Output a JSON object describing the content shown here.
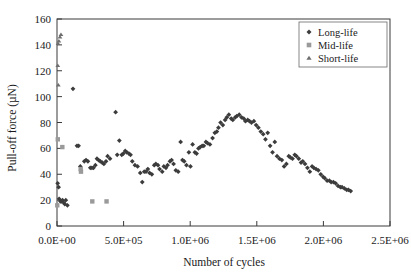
{
  "chart_data": {
    "type": "scatter",
    "title": "",
    "xlabel": "Number of cycles",
    "ylabel": "Pull-off force (µN)",
    "xlim": [
      0,
      2500000
    ],
    "ylim": [
      0,
      160
    ],
    "xticks": [
      0,
      500000,
      1000000,
      1500000,
      2000000,
      2500000
    ],
    "xtick_labels": [
      "0.0E+00",
      "5.0E+05",
      "1.0E+06",
      "1.5E+06",
      "2.0E+06",
      "2.5E+06"
    ],
    "yticks": [
      0,
      20,
      40,
      60,
      80,
      100,
      120,
      140,
      160
    ],
    "ytick_labels": [
      "0",
      "20",
      "40",
      "60",
      "80",
      "100",
      "120",
      "140",
      "160"
    ],
    "grid": false,
    "legend_position": "top-right",
    "series": [
      {
        "name": "Long-life",
        "marker": "diamond",
        "color": "#3c3c3c",
        "points": [
          [
            5000,
            33
          ],
          [
            12000,
            30
          ],
          [
            16000,
            21
          ],
          [
            26000,
            19
          ],
          [
            34000,
            19
          ],
          [
            42000,
            20
          ],
          [
            50000,
            18
          ],
          [
            58000,
            17
          ],
          [
            66000,
            20
          ],
          [
            78000,
            16
          ],
          [
            120000,
            106
          ],
          [
            150000,
            62
          ],
          [
            162000,
            62
          ],
          [
            175000,
            46
          ],
          [
            205000,
            50
          ],
          [
            218000,
            51
          ],
          [
            232000,
            50
          ],
          [
            250000,
            45
          ],
          [
            262000,
            45
          ],
          [
            274000,
            45
          ],
          [
            288000,
            47
          ],
          [
            300000,
            52
          ],
          [
            312000,
            51
          ],
          [
            325000,
            50
          ],
          [
            340000,
            49
          ],
          [
            352000,
            48
          ],
          [
            368000,
            50
          ],
          [
            380000,
            54
          ],
          [
            398000,
            52
          ],
          [
            440000,
            88
          ],
          [
            452000,
            55
          ],
          [
            468000,
            66
          ],
          [
            486000,
            55
          ],
          [
            498000,
            56
          ],
          [
            512000,
            58
          ],
          [
            524000,
            57
          ],
          [
            540000,
            56
          ],
          [
            552000,
            55
          ],
          [
            565000,
            50
          ],
          [
            585000,
            47
          ],
          [
            605000,
            46
          ],
          [
            625000,
            41
          ],
          [
            640000,
            34
          ],
          [
            655000,
            42
          ],
          [
            668000,
            42
          ],
          [
            682000,
            44
          ],
          [
            695000,
            41
          ],
          [
            712000,
            40
          ],
          [
            730000,
            47
          ],
          [
            742000,
            48
          ],
          [
            758000,
            47
          ],
          [
            770000,
            44
          ],
          [
            790000,
            42
          ],
          [
            802000,
            46
          ],
          [
            818000,
            45
          ],
          [
            830000,
            47
          ],
          [
            848000,
            50
          ],
          [
            860000,
            51
          ],
          [
            875000,
            48
          ],
          [
            892000,
            43
          ],
          [
            910000,
            42
          ],
          [
            928000,
            65
          ],
          [
            942000,
            51
          ],
          [
            955000,
            50
          ],
          [
            972000,
            47
          ],
          [
            990000,
            57
          ],
          [
            1002000,
            46
          ],
          [
            1018000,
            63
          ],
          [
            1035000,
            57
          ],
          [
            1048000,
            56
          ],
          [
            1062000,
            60
          ],
          [
            1075000,
            61
          ],
          [
            1090000,
            62
          ],
          [
            1102000,
            62
          ],
          [
            1118000,
            65
          ],
          [
            1130000,
            64
          ],
          [
            1148000,
            63
          ],
          [
            1168000,
            68
          ],
          [
            1185000,
            72
          ],
          [
            1200000,
            73
          ],
          [
            1212000,
            76
          ],
          [
            1228000,
            80
          ],
          [
            1245000,
            78
          ],
          [
            1262000,
            82
          ],
          [
            1275000,
            84
          ],
          [
            1290000,
            86
          ],
          [
            1308000,
            83
          ],
          [
            1320000,
            82
          ],
          [
            1338000,
            84
          ],
          [
            1350000,
            85
          ],
          [
            1368000,
            86
          ],
          [
            1385000,
            84
          ],
          [
            1402000,
            83
          ],
          [
            1415000,
            81
          ],
          [
            1432000,
            82
          ],
          [
            1445000,
            81
          ],
          [
            1460000,
            80
          ],
          [
            1478000,
            81
          ],
          [
            1495000,
            78
          ],
          [
            1512000,
            76
          ],
          [
            1530000,
            73
          ],
          [
            1548000,
            71
          ],
          [
            1565000,
            67
          ],
          [
            1582000,
            72
          ],
          [
            1600000,
            62
          ],
          [
            1618000,
            57
          ],
          [
            1635000,
            65
          ],
          [
            1652000,
            54
          ],
          [
            1670000,
            52
          ],
          [
            1688000,
            51
          ],
          [
            1705000,
            46
          ],
          [
            1722000,
            48
          ],
          [
            1740000,
            54
          ],
          [
            1752000,
            53
          ],
          [
            1768000,
            52
          ],
          [
            1785000,
            55
          ],
          [
            1798000,
            54
          ],
          [
            1815000,
            52
          ],
          [
            1832000,
            49
          ],
          [
            1845000,
            50
          ],
          [
            1862000,
            48
          ],
          [
            1880000,
            45
          ],
          [
            1898000,
            42
          ],
          [
            1915000,
            46
          ],
          [
            1928000,
            45
          ],
          [
            1945000,
            44
          ],
          [
            1962000,
            43
          ],
          [
            1980000,
            40
          ],
          [
            1998000,
            38
          ],
          [
            2010000,
            37
          ],
          [
            2028000,
            35
          ],
          [
            2045000,
            35
          ],
          [
            2058000,
            34
          ],
          [
            2075000,
            34
          ],
          [
            2092000,
            33
          ],
          [
            2110000,
            31
          ],
          [
            2128000,
            30
          ],
          [
            2140000,
            30
          ],
          [
            2158000,
            29
          ],
          [
            2175000,
            28
          ],
          [
            2188000,
            28
          ],
          [
            2205000,
            27
          ]
        ]
      },
      {
        "name": "Mid-life",
        "marker": "square",
        "color": "#9a9a9a",
        "points": [
          [
            2000,
            16
          ],
          [
            6000,
            67
          ],
          [
            40000,
            61
          ],
          [
            178000,
            44
          ],
          [
            180000,
            42
          ],
          [
            265000,
            19
          ],
          [
            372000,
            19
          ]
        ]
      },
      {
        "name": "Short-life",
        "marker": "triangle",
        "color": "#6e6e6e",
        "points": [
          [
            8000,
            141
          ],
          [
            14000,
            143
          ],
          [
            22000,
            146
          ],
          [
            30000,
            148
          ],
          [
            6000,
            124
          ],
          [
            10000,
            109
          ]
        ]
      }
    ]
  },
  "legend": {
    "entries": [
      {
        "label": "Long-life",
        "marker": "diamond",
        "color": "#3c3c3c"
      },
      {
        "label": "Mid-life",
        "marker": "square",
        "color": "#9a9a9a"
      },
      {
        "label": "Short-life",
        "marker": "triangle",
        "color": "#6e6e6e"
      }
    ]
  }
}
